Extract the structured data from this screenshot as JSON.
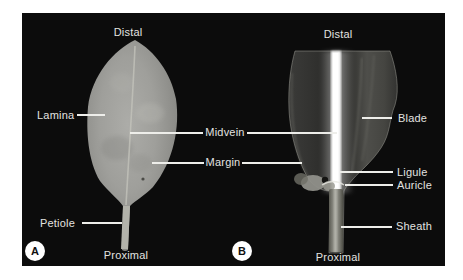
{
  "figure": {
    "panel_a": {
      "marker": "A",
      "distal_label": "Distal",
      "lamina_label": "Lamina",
      "petiole_label": "Petiole",
      "proximal_label": "Proximal"
    },
    "panel_b": {
      "marker": "B",
      "distal_label": "Distal",
      "blade_label": "Blade",
      "ligule_label": "Ligule",
      "auricle_label": "Auricle",
      "sheath_label": "Sheath",
      "proximal_label": "Proximal"
    },
    "shared_labels": {
      "midvein": "Midvein",
      "margin": "Margin"
    },
    "colors": {
      "page_background": "#ffffff",
      "photo_background": "#0c0c0c",
      "label_text": "#e3e3e0",
      "leader_line": "#eeeeea",
      "marker_background": "#ffffff",
      "marker_text": "#101010"
    }
  }
}
